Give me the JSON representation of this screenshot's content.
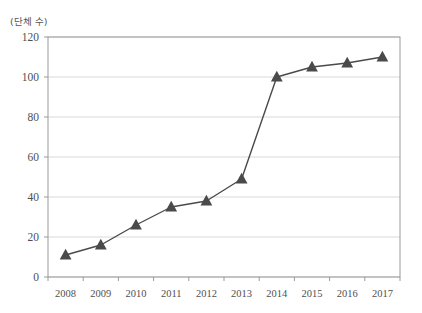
{
  "figure": {
    "top_cropped_text": "",
    "unit_label": "(단체 수)"
  },
  "chart_data": {
    "type": "line",
    "title": "",
    "subtitle": "",
    "xlabel": "",
    "ylabel": "(단체 수)",
    "categories": [
      "2008",
      "2009",
      "2010",
      "2011",
      "2012",
      "2013",
      "2014",
      "2015",
      "2016",
      "2017"
    ],
    "values": [
      11,
      16,
      26,
      35,
      38,
      49,
      100,
      105,
      107,
      110
    ],
    "series": [
      {
        "name": "단체 수",
        "values": [
          11,
          16,
          26,
          35,
          38,
          49,
          100,
          105,
          107,
          110
        ],
        "marker": "triangle",
        "color": "#4a4a4a"
      }
    ],
    "ylim": [
      0,
      120
    ],
    "ytick_step": 20,
    "yticks": [
      "0",
      "20",
      "40",
      "60",
      "80",
      "100",
      "120"
    ],
    "grid": "horizontal",
    "legend": "none",
    "annotations": []
  },
  "colors": {
    "line": "#4a4a4a",
    "marker": "#4a4a4a",
    "grid": "#d9d9d9",
    "frame": "#9a9a9a",
    "text": "#4f4f4f",
    "background": "#ffffff"
  }
}
